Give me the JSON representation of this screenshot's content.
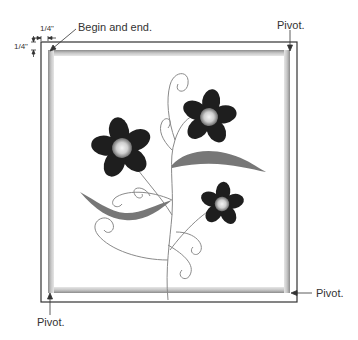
{
  "diagram": {
    "labels": {
      "begin_end": "Begin and end.",
      "pivot_top_right": "Pivot.",
      "pivot_bottom_right": "Pivot.",
      "pivot_bottom_left": "Pivot."
    },
    "dimensions": {
      "horizontal_offset": "1/4\"",
      "vertical_offset": "1/4\""
    },
    "colors": {
      "outline": "#333333",
      "band": "#a8a8a8",
      "petal": "#1e1e1e",
      "leaf": "#777777",
      "stem": "#888888"
    },
    "flowers": [
      {
        "name": "large-left-flower",
        "cx": 122,
        "cy": 148
      },
      {
        "name": "upper-right-flower",
        "cx": 209,
        "cy": 117
      },
      {
        "name": "small-lower-right-flower",
        "cx": 222,
        "cy": 204
      }
    ]
  }
}
